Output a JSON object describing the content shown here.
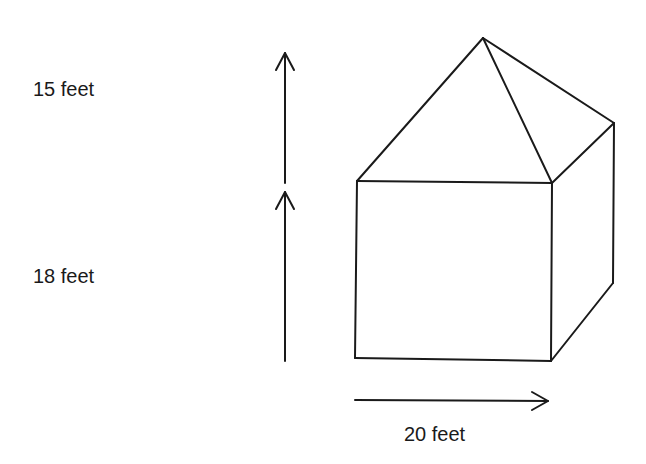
{
  "diagram": {
    "type": "house-shaped solid (rectangular prism with pyramid roof)",
    "labels": {
      "roof_height": "15 feet",
      "wall_height": "18 feet",
      "width": "20 feet"
    },
    "colors": {
      "stroke": "#1a1a1a",
      "background": "#ffffff"
    }
  }
}
